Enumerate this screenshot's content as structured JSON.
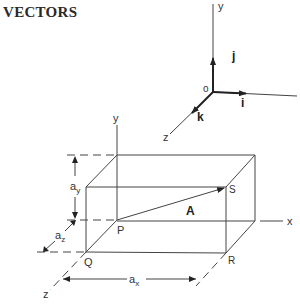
{
  "title": "VECTORS",
  "unit_axes": {
    "origin_label": "o",
    "y_label": "y",
    "z_label": "z",
    "i_label": "i",
    "j_label": "j",
    "k_label": "k"
  },
  "box_diagram": {
    "y_axis_label": "y",
    "x_axis_label": "x",
    "z_axis_label": "z",
    "vector_label": "A",
    "point_P": "P",
    "point_Q": "Q",
    "point_R": "R",
    "point_S": "S",
    "dimension_ax": "a",
    "dimension_ax_sub": "x",
    "dimension_ay": "a",
    "dimension_ay_sub": "y",
    "dimension_az": "a",
    "dimension_az_sub": "z"
  }
}
